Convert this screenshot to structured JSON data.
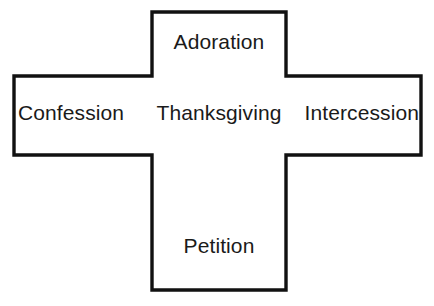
{
  "diagram": {
    "name": "prayer-cross",
    "shape": "cross",
    "background_color": "#ffffff",
    "stroke_color": "#111111",
    "text_color": "#1a1a1a",
    "labels": {
      "top": "Adoration",
      "left": "Confession",
      "center": "Thanksgiving",
      "right": "Intercession",
      "bottom": "Petition"
    }
  }
}
